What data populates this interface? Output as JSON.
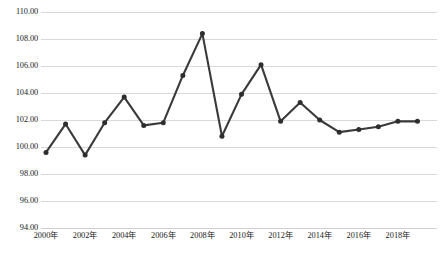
{
  "chart_data": {
    "type": "line",
    "title": "",
    "subtitle": "",
    "xlabel": "",
    "ylabel": "",
    "categories": [
      "2000年",
      "2001年",
      "2002年",
      "2003年",
      "2004年",
      "2005年",
      "2006年",
      "2007年",
      "2008年",
      "2009年",
      "2010年",
      "2011年",
      "2012年",
      "2013年",
      "2014年",
      "2015年",
      "2016年",
      "2017年",
      "2018年",
      "2019年"
    ],
    "x": [
      2000,
      2001,
      2002,
      2003,
      2004,
      2005,
      2006,
      2007,
      2008,
      2009,
      2010,
      2011,
      2012,
      2013,
      2014,
      2015,
      2016,
      2017,
      2018,
      2019
    ],
    "values": [
      99.6,
      101.7,
      99.4,
      101.8,
      103.7,
      101.6,
      101.8,
      105.3,
      108.4,
      100.8,
      103.9,
      106.1,
      101.9,
      103.3,
      102.0,
      101.1,
      101.3,
      101.5,
      101.9,
      101.9
    ],
    "series": [
      {
        "name": "",
        "values": [
          99.6,
          101.7,
          99.4,
          101.8,
          103.7,
          101.6,
          101.8,
          105.3,
          108.4,
          100.8,
          103.9,
          106.1,
          101.9,
          103.3,
          102.0,
          101.1,
          101.3,
          101.5,
          101.9,
          101.9
        ]
      }
    ],
    "ylim": [
      94.0,
      110.0
    ],
    "ytick_values": [
      110.0,
      108.0,
      106.0,
      104.0,
      102.0,
      100.0,
      98.0,
      96.0,
      94.0
    ],
    "ytick_labels": [
      "110.00",
      "108.00",
      "106.00",
      "104.00",
      "102.00",
      "100.00",
      "98.00",
      "96.00",
      "94.00"
    ],
    "xtick_values": [
      2000,
      2002,
      2004,
      2006,
      2008,
      2010,
      2012,
      2014,
      2016,
      2018
    ],
    "xtick_labels": [
      "2000年",
      "2002年",
      "2004年",
      "2006年",
      "2008年",
      "2010年",
      "2012年",
      "2014年",
      "2016年",
      "2018年"
    ],
    "grid": true,
    "grid_axis": "y",
    "legend": false,
    "legend_position": "none",
    "line_color": "#3a3a3a",
    "marker_color": "#2e2e2e",
    "grid_color": "#d9d9d9",
    "background_color": "#ffffff",
    "markers": true,
    "annotations": []
  },
  "caption": {
    "text": ""
  }
}
